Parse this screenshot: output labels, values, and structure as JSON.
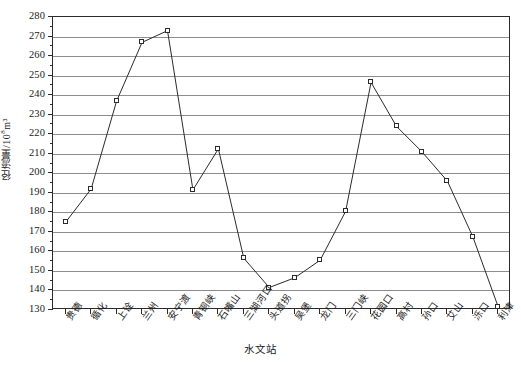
{
  "chart_data": {
    "type": "line",
    "title": "",
    "xlabel": "水文站",
    "ylabel": "径流量/10⁸m³",
    "ylabel_main": "径流量/10",
    "ylabel_exp": "8",
    "ylabel_unit": "m³",
    "ylim": [
      130,
      280
    ],
    "ytick_step": 10,
    "yticks": [
      130,
      140,
      150,
      160,
      170,
      180,
      190,
      200,
      210,
      220,
      230,
      240,
      250,
      260,
      270,
      280
    ],
    "grid": true,
    "legend": "none",
    "marker": "open-square",
    "line_color": "#2b2b2b",
    "grid_color": "#8d8d8d",
    "axis_color": "#2b2b2b",
    "categories": [
      "贵德",
      "循化",
      "上诠",
      "兰州",
      "安宁渡",
      "青铜峡",
      "石嘴山",
      "三湖河口",
      "头道拐",
      "吴堡",
      "龙门",
      "三门峡",
      "花园口",
      "高村",
      "孙口",
      "艾山",
      "泺口",
      "利津"
    ],
    "values": [
      175,
      192,
      237,
      267,
      273,
      191.5,
      212.5,
      156.5,
      141.5,
      146.5,
      155.5,
      180.5,
      246.5,
      224,
      211,
      196,
      167.5,
      131.5
    ],
    "series": [
      {
        "name": "径流量",
        "values": [
          175,
          192,
          237,
          267,
          273,
          191.5,
          212.5,
          156.5,
          141.5,
          146.5,
          155.5,
          180.5,
          246.5,
          224,
          211,
          196,
          167.5,
          131.5
        ]
      }
    ]
  }
}
